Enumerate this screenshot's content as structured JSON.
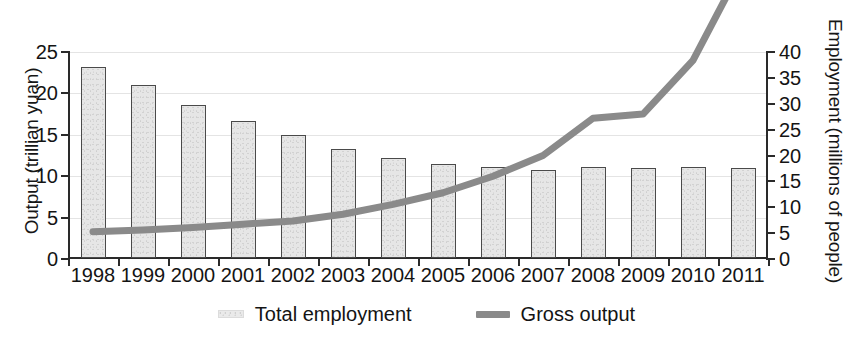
{
  "chart_data": {
    "type": "bar",
    "title": "",
    "subtitle": "",
    "xlabel": "",
    "ylabel": "Output (trillian yuan)",
    "y2label": "Employment (millions of people)",
    "categories": [
      "1998",
      "1999",
      "2000",
      "2001",
      "2002",
      "2003",
      "2004",
      "2005",
      "2006",
      "2007",
      "2008",
      "2009",
      "2010",
      "2011"
    ],
    "ylim": [
      0,
      25
    ],
    "yticks": [
      0,
      5,
      10,
      15,
      20,
      25
    ],
    "y2lim": [
      0,
      40
    ],
    "y2ticks": [
      0,
      5,
      10,
      15,
      20,
      25,
      30,
      35,
      40
    ],
    "grid": true,
    "legend_position": "bottom",
    "series": [
      {
        "name": "Total employment",
        "kind": "bar",
        "axis": "right",
        "unit": "millions of people",
        "color": "#e6e6e6",
        "edge_color": "#4a4a4a",
        "values": [
          37.0,
          33.5,
          29.5,
          26.5,
          23.8,
          21.0,
          19.3,
          18.2,
          17.6,
          17.0,
          17.5,
          17.4,
          17.5,
          17.3
        ]
      },
      {
        "name": "Gross output",
        "kind": "line",
        "axis": "left",
        "unit": "trillian yuan",
        "color": "#8a8a8a",
        "values": [
          3.3,
          3.5,
          3.8,
          4.2,
          4.6,
          5.4,
          6.6,
          8.0,
          10.0,
          12.5,
          17.0,
          17.5,
          24.0,
          35.5
        ]
      }
    ],
    "legend": [
      {
        "label": "Total employment",
        "marker": "bar-swatch-icon"
      },
      {
        "label": "Gross output",
        "marker": "line-swatch-icon"
      }
    ]
  }
}
